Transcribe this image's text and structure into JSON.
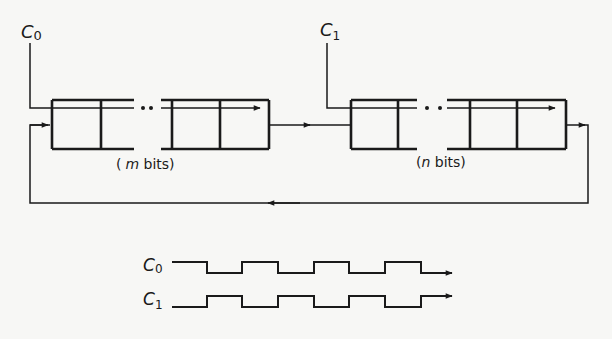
{
  "diagram": {
    "colors": {
      "ink": "#1a1a1a",
      "background": "#f7f7f5"
    },
    "clocks": [
      {
        "id": "c0",
        "label_main": "C",
        "label_sub": "0"
      },
      {
        "id": "c1",
        "label_main": "C",
        "label_sub": "1"
      }
    ],
    "registers": [
      {
        "id": "reg-m",
        "caption_open": "(",
        "caption_var": "m",
        "caption_rest": " bits)",
        "clock": "c0",
        "ellipsis": "••"
      },
      {
        "id": "reg-n",
        "caption_open": "(",
        "caption_var": "n",
        "caption_rest": " bits)",
        "clock": "c1",
        "ellipsis": "••"
      }
    ],
    "connections": [
      {
        "from": "reg-m",
        "to": "reg-n",
        "type": "data"
      },
      {
        "from": "reg-n",
        "to": "reg-m",
        "type": "feedback"
      }
    ],
    "timing": {
      "signals": [
        {
          "label_main": "C",
          "label_sub": "0",
          "start_level": "high",
          "pattern": "H L H L H L H L"
        },
        {
          "label_main": "C",
          "label_sub": "1",
          "start_level": "low",
          "pattern": "L H L H L H L H"
        }
      ]
    }
  }
}
